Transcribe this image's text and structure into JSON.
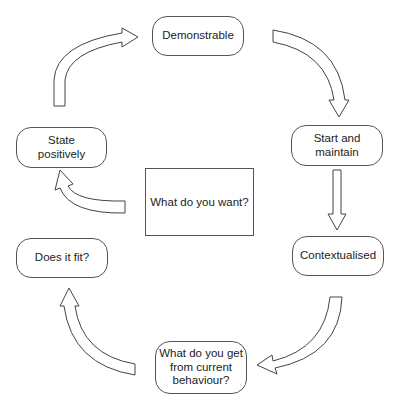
{
  "diagram": {
    "center": {
      "label": "What do you want?"
    },
    "nodes": [
      {
        "id": "demonstrable",
        "label": "Demonstrable"
      },
      {
        "id": "start-and-maintain",
        "label": "Start and\nmaintain"
      },
      {
        "id": "contextualised",
        "label": "Contextualised"
      },
      {
        "id": "what-do-you-get",
        "label": "What do you get\nfrom current\nbehaviour?"
      },
      {
        "id": "does-it-fit",
        "label": "Does it fit?"
      },
      {
        "id": "state-positively",
        "label": "State\npositively"
      }
    ],
    "arrows": [
      {
        "from": "state-positively",
        "to": "demonstrable",
        "shape": "curved"
      },
      {
        "from": "demonstrable",
        "to": "start-and-maintain",
        "shape": "curved"
      },
      {
        "from": "start-and-maintain",
        "to": "contextualised",
        "shape": "straight"
      },
      {
        "from": "contextualised",
        "to": "what-do-you-get",
        "shape": "curved"
      },
      {
        "from": "what-do-you-get",
        "to": "does-it-fit",
        "shape": "curved"
      },
      {
        "from": "center",
        "to": "state-positively",
        "shape": "curved"
      }
    ],
    "colors": {
      "stroke": "#555555",
      "fill": "#ffffff",
      "text": "#222222"
    }
  }
}
